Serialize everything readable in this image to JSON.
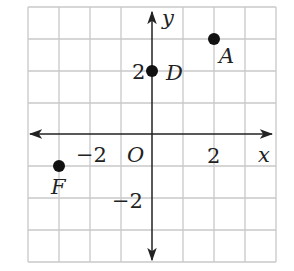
{
  "diagram": {
    "type": "coordinate-plane",
    "grid": {
      "x_min": -4,
      "x_max": 4,
      "y_min": -4,
      "y_max": 4,
      "step": 1,
      "color": "#c8c8c8"
    },
    "axes": {
      "x_label": "x",
      "y_label": "y",
      "origin_label": "O",
      "color": "#222222"
    },
    "ticks": {
      "x_pos": "2",
      "x_neg": "−2",
      "y_pos": "2",
      "y_neg": "−2"
    },
    "points": [
      {
        "name": "A",
        "x": 2,
        "y": 3
      },
      {
        "name": "D",
        "x": 0,
        "y": 2
      },
      {
        "name": "F",
        "x": -3,
        "y": -1
      }
    ],
    "point_color": "#111111"
  }
}
